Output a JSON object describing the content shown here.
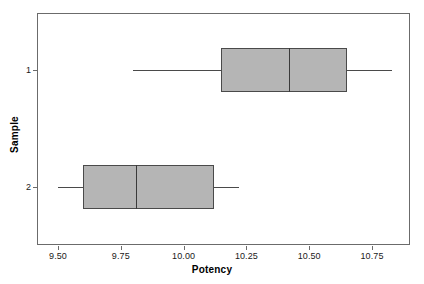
{
  "chart_data": {
    "type": "box",
    "title": "",
    "xlabel": "Potency",
    "ylabel": "Sample",
    "xlim": [
      9.39,
      10.87
    ],
    "xticks": [
      "9.50",
      "9.75",
      "10.00",
      "10.25",
      "10.50",
      "10.75"
    ],
    "xtick_values": [
      9.5,
      9.75,
      10.0,
      10.25,
      10.5,
      10.75
    ],
    "yticks": [
      "1",
      "2"
    ],
    "grid": false,
    "orientation": "horizontal",
    "legend": "none",
    "box_fill_color": "#b5b5b5",
    "box_line_color": "#4a4a4a",
    "frame_color": "#6b6b6b",
    "categories": [
      "1",
      "2"
    ],
    "boxes": [
      {
        "category": "1",
        "whisker_low": 9.8,
        "q1": 10.15,
        "median": 10.42,
        "q3": 10.65,
        "whisker_high": 10.83,
        "outliers": []
      },
      {
        "category": "2",
        "whisker_low": 9.5,
        "q1": 9.6,
        "median": 9.81,
        "q3": 10.12,
        "whisker_high": 10.22,
        "outliers": []
      }
    ]
  },
  "axes": {
    "x_title": "Potency",
    "y_title": "Sample",
    "x_tick_labels": [
      "9.50",
      "9.75",
      "10.00",
      "10.25",
      "10.50",
      "10.75"
    ],
    "y_tick_labels": [
      "1",
      "2"
    ]
  }
}
